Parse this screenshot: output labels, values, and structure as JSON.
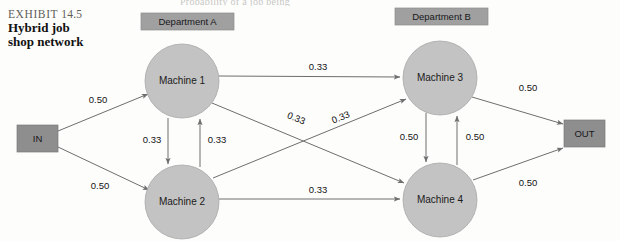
{
  "page": {
    "running_head": "Probability of a job being",
    "exhibit_number_prefix": "EXHIBIT",
    "exhibit_number": "14.5",
    "exhibit_title_line1": "Hybrid job",
    "exhibit_title_line2": "shop network"
  },
  "colors": {
    "node_fill": "#c3c3c3",
    "node_stroke": "#a8a8a8",
    "dept_fill": "#a0a0a0",
    "dept_stroke": "#8c8c8c",
    "terminal_fill": "#8e8e8e",
    "terminal_stroke": "#7a7a7a",
    "edge": "#6e6e6e",
    "text": "#1a1a1a",
    "caption_gray": "#5d5d59",
    "background": "#fdfdfc"
  },
  "departments": [
    {
      "id": "dept-a",
      "label": "Department A"
    },
    {
      "id": "dept-b",
      "label": "Department B"
    }
  ],
  "terminals": [
    {
      "id": "in",
      "label": "IN"
    },
    {
      "id": "out",
      "label": "OUT"
    }
  ],
  "nodes": [
    {
      "id": "machine-1",
      "label": "Machine 1"
    },
    {
      "id": "machine-2",
      "label": "Machine 2"
    },
    {
      "id": "machine-3",
      "label": "Machine 3"
    },
    {
      "id": "machine-4",
      "label": "Machine 4"
    }
  ],
  "edges": [
    {
      "id": "in-to-machine-1",
      "from": "IN",
      "to": "Machine 1",
      "label": "0.50"
    },
    {
      "id": "in-to-machine-2",
      "from": "IN",
      "to": "Machine 2",
      "label": "0.50"
    },
    {
      "id": "machine-1-to-machine-2",
      "from": "Machine 1",
      "to": "Machine 2",
      "label": "0.33"
    },
    {
      "id": "machine-2-to-machine-1",
      "from": "Machine 2",
      "to": "Machine 1",
      "label": "0.33"
    },
    {
      "id": "machine-1-to-machine-3",
      "from": "Machine 1",
      "to": "Machine 3",
      "label": "0.33"
    },
    {
      "id": "machine-1-to-machine-4",
      "from": "Machine 1",
      "to": "Machine 4",
      "label": "0.33"
    },
    {
      "id": "machine-2-to-machine-3",
      "from": "Machine 2",
      "to": "Machine 3",
      "label": "0.33"
    },
    {
      "id": "machine-2-to-machine-4",
      "from": "Machine 2",
      "to": "Machine 4",
      "label": "0.33"
    },
    {
      "id": "machine-3-to-machine-4",
      "from": "Machine 3",
      "to": "Machine 4",
      "label": "0.50"
    },
    {
      "id": "machine-4-to-machine-3",
      "from": "Machine 4",
      "to": "Machine 3",
      "label": "0.50"
    },
    {
      "id": "machine-3-to-out",
      "from": "Machine 3",
      "to": "OUT",
      "label": "0.50"
    },
    {
      "id": "machine-4-to-out",
      "from": "Machine 4",
      "to": "OUT",
      "label": "0.50"
    }
  ]
}
